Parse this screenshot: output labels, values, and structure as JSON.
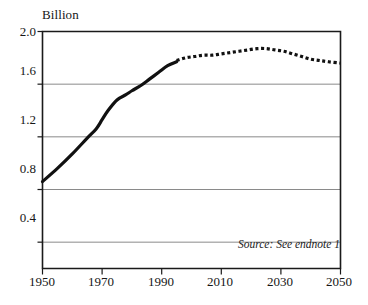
{
  "chart_data": {
    "type": "line",
    "title": "",
    "subtitle": "",
    "unit_label": "Billion",
    "xlabel": "",
    "ylabel": "Billion",
    "xlim": [
      1950,
      2050
    ],
    "ylim": [
      0.2,
      2.0
    ],
    "grid": true,
    "grid_axis": "y",
    "legend": false,
    "legend_position": "none",
    "y_ticks": [
      2.0,
      1.6,
      1.2,
      0.8,
      0.4
    ],
    "y_tick_labels": [
      "2.0",
      "1.6",
      "1.2",
      "0.8",
      "0.4"
    ],
    "x_ticks": [
      1950,
      1970,
      1990,
      2010,
      2030,
      2050
    ],
    "x_tick_labels": [
      "1950",
      "1970",
      "1990",
      "2010",
      "2030",
      "2050"
    ],
    "annotations": [
      {
        "name": "source-note",
        "text": "Source: See endnote 1"
      }
    ],
    "series": [
      {
        "name": "Historical",
        "style": "solid",
        "color": "#111111",
        "width": 3.2,
        "x": [
          1950,
          1955,
          1960,
          1965,
          1968,
          1970,
          1972,
          1975,
          1978,
          1980,
          1983,
          1986,
          1989,
          1992,
          1995
        ],
        "values": [
          0.86,
          0.96,
          1.07,
          1.19,
          1.26,
          1.33,
          1.4,
          1.48,
          1.52,
          1.55,
          1.59,
          1.64,
          1.69,
          1.74,
          1.77
        ]
      },
      {
        "name": "Projected",
        "style": "dotted",
        "color": "#111111",
        "width": 3.2,
        "x": [
          1995,
          1998,
          2001,
          2004,
          2007,
          2010,
          2013,
          2016,
          2019,
          2022,
          2025,
          2028,
          2031,
          2034,
          2037,
          2040,
          2043,
          2046,
          2050
        ],
        "values": [
          1.78,
          1.8,
          1.81,
          1.82,
          1.82,
          1.83,
          1.84,
          1.85,
          1.86,
          1.87,
          1.87,
          1.86,
          1.85,
          1.83,
          1.81,
          1.79,
          1.78,
          1.77,
          1.76
        ]
      }
    ]
  },
  "axes": {
    "unit_label": "Billion",
    "y_tick_labels": [
      "2.0",
      "1.6",
      "1.2",
      "0.8",
      "0.4"
    ],
    "x_tick_labels": [
      "1950",
      "1970",
      "1990",
      "2010",
      "2030",
      "2050"
    ]
  },
  "notes": {
    "source": "Source: See endnote 1"
  },
  "colors": {
    "line": "#111111",
    "grid": "#8a8a8a",
    "axis": "#1a1a1a",
    "background": "#ffffff",
    "text": "#161616"
  }
}
